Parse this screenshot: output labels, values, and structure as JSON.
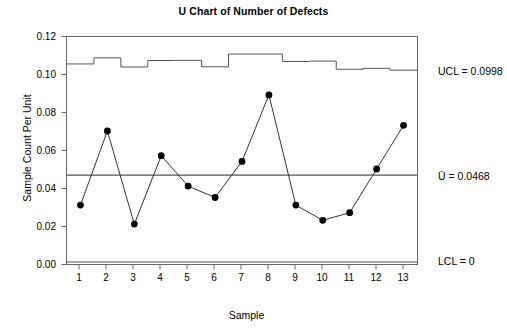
{
  "chart_data": {
    "type": "line",
    "title": "U Chart of Number of Defects",
    "xlabel": "Sample",
    "ylabel": "Sample Count Per Unit",
    "categories": [
      1,
      2,
      3,
      4,
      5,
      6,
      7,
      8,
      9,
      10,
      11,
      12,
      13
    ],
    "x_tick_labels": [
      "1",
      "2",
      "3",
      "4",
      "5",
      "6",
      "7",
      "8",
      "9",
      "10",
      "11",
      "12",
      "13"
    ],
    "y_tick_labels": [
      "0.00",
      "0.02",
      "0.04",
      "0.06",
      "0.08",
      "0.10",
      "0.12"
    ],
    "y_ticks": [
      0.0,
      0.02,
      0.04,
      0.06,
      0.08,
      0.1,
      0.12
    ],
    "ylim": [
      0.0,
      0.12
    ],
    "xlim": [
      0.5,
      13.5
    ],
    "grid": false,
    "legend": "none",
    "series": [
      {
        "name": "Sample Count Per Unit",
        "values": [
          0.031,
          0.07,
          0.021,
          0.057,
          0.041,
          0.035,
          0.054,
          0.089,
          0.031,
          0.023,
          0.027,
          0.05,
          0.073
        ],
        "marker": "filled-circle",
        "color": "#000000"
      },
      {
        "name": "UCL (stepped, varying sample size)",
        "values": [
          0.1053,
          0.1085,
          0.1037,
          0.1071,
          0.1072,
          0.1038,
          0.1105,
          0.1105,
          0.1066,
          0.1068,
          0.1025,
          0.103,
          0.102
        ],
        "step": true,
        "color": "#555555"
      }
    ],
    "control_limits": {
      "ucl_label": "UCL = 0.0998",
      "ucl_value": 0.0998,
      "center_label": "Ū = 0.0468",
      "center_value": 0.0468,
      "lcl_label": "LCL = 0",
      "lcl_value": 0
    },
    "colors": {
      "line": "#333333",
      "marker": "#000000",
      "limit_line": "#555555",
      "frame": "#666666",
      "background": "#ffffff"
    }
  },
  "annotations": {
    "ucl": "UCL = 0.0998",
    "center": "Ū = 0.0468",
    "lcl": "LCL = 0"
  }
}
